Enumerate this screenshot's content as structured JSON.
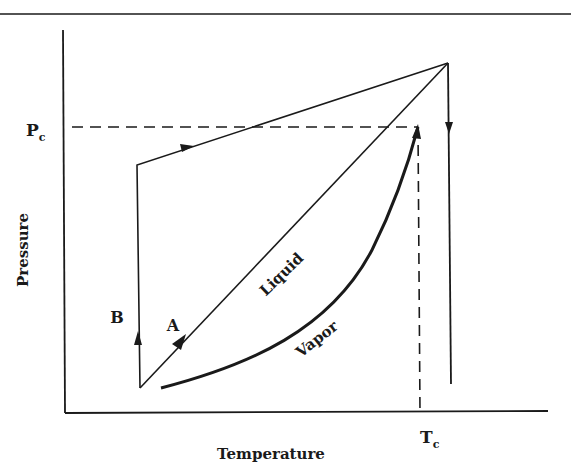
{
  "figure": {
    "x_axis_label": "Temperature",
    "y_axis_label": "Pressure",
    "critical_pressure_label": {
      "main": "P",
      "sub": "c"
    },
    "critical_temperature_label": {
      "main": "T",
      "sub": "c"
    },
    "path_labels": {
      "a": "A",
      "b": "B"
    },
    "region_labels": {
      "liquid": "Liquid",
      "vapor": "Vapor"
    },
    "colors": {
      "ink": "#1a1a1a",
      "background": "#ffffff"
    }
  }
}
